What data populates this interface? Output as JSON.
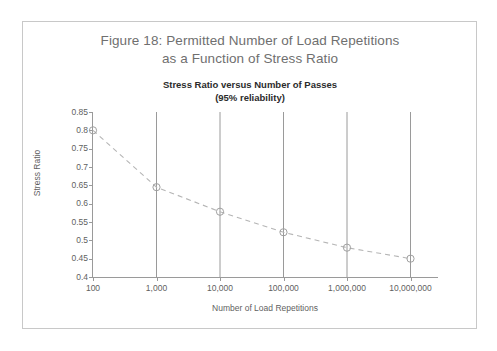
{
  "figure": {
    "caption_line1": "Figure 18: Permitted Number of Load Repetitions",
    "caption_line2": "as a Function of Stress Ratio"
  },
  "colors": {
    "frame": "#c8c8c8",
    "caption_text": "#6f6f6f",
    "title_text": "#2b2b2b",
    "axis": "#9a9a9a",
    "gridline": "#9a9a9a",
    "series_line": "#b5b5b5",
    "marker_stroke": "#a0a0a0",
    "background": "#ffffff"
  },
  "chart_data": {
    "type": "line",
    "title": "Stress Ratio versus Number of Passes",
    "subtitle": "(95% reliability)",
    "xlabel": "Number of Load Repetitions",
    "ylabel": "Stress Ratio",
    "xscale": "log",
    "x": [
      100,
      1000,
      10000,
      100000,
      1000000,
      10000000
    ],
    "xtick_labels": [
      "100",
      "1,000",
      "10,000",
      "100,000",
      "1,000,000",
      "10,000,000"
    ],
    "values": [
      0.8,
      0.645,
      0.578,
      0.522,
      0.48,
      0.45
    ],
    "ylim": [
      0.4,
      0.85
    ],
    "ytick_labels": [
      "0.85",
      "0.8",
      "0.75",
      "0.7",
      "0.65",
      "0.6",
      "0.55",
      "0.5",
      "0.45",
      "0.4"
    ],
    "ytick_values": [
      0.85,
      0.8,
      0.75,
      0.7,
      0.65,
      0.6,
      0.55,
      0.5,
      0.45,
      0.4
    ],
    "grid": "vertical",
    "legend": "none",
    "line_style": "dashed",
    "marker": "open-circle",
    "series": [
      {
        "name": "Stress Ratio",
        "values": [
          0.8,
          0.645,
          0.578,
          0.522,
          0.48,
          0.45
        ]
      }
    ]
  }
}
